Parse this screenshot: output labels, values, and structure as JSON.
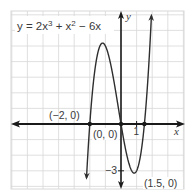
{
  "chart_data": {
    "type": "line",
    "equation": {
      "prefix": "y = 2x",
      "exp1": "3",
      "mid": " + x",
      "exp2": "2",
      "suffix": " − 6x",
      "coefficients": [
        2,
        1,
        -6,
        0
      ]
    },
    "xlabel": "x",
    "ylabel": "y",
    "xlim": [
      -7,
      4
    ],
    "ylim": [
      -4,
      7
    ],
    "grid": true,
    "tick_labels": {
      "x_one": "1",
      "y_neg_three": "−3"
    },
    "annotations": [
      {
        "label": "(−2, 0)",
        "x": -2,
        "y": 0
      },
      {
        "label": "(0, 0)",
        "x": 0,
        "y": 0
      },
      {
        "label": "(1.5, 0)",
        "x": 1.5,
        "y": 0
      }
    ],
    "series": [
      {
        "name": "y = 2x³ + x² − 6x",
        "x": [
          -2.2,
          -2,
          -1.5,
          -1.18,
          -1,
          -0.5,
          0,
          0.5,
          0.85,
          1,
          1.5,
          2
        ],
        "y": [
          -3.62,
          0,
          4.5,
          5.05,
          5,
          3,
          0,
          -2.5,
          -3.15,
          -3,
          0,
          8
        ]
      }
    ],
    "colors": {
      "grid": "#d8d8d8",
      "axis": "#1a1a1a",
      "curve": "#2e2e2e",
      "point": "#1a1a1a"
    }
  }
}
